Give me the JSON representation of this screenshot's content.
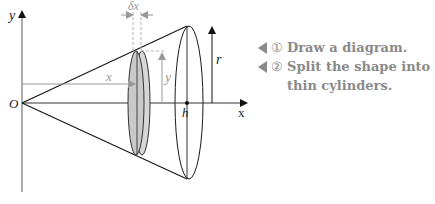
{
  "diagram": {
    "labels": {
      "y_axis": "y",
      "x_axis": "x",
      "origin": "O",
      "delta_x": "δx",
      "x_distance": "x",
      "y_height": "y",
      "radius": "r",
      "height": "h"
    },
    "colors": {
      "line": "#1a1a1a",
      "grey_line": "#999999",
      "disk_fill": "#cfcfcf",
      "note_text": "#8a8a8a"
    }
  },
  "notes": [
    {
      "marker": "◀",
      "number": "①",
      "text": "Draw a diagram."
    },
    {
      "marker": "◀",
      "number": "②",
      "text": "Split the shape into thin cylinders."
    }
  ]
}
